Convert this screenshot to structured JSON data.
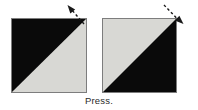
{
  "figure": {
    "width": 198,
    "height": 110,
    "background_color": "#ffffff",
    "caption": "Press.",
    "caption_color": "#2a2a2a"
  },
  "colors": {
    "dark": "#0a0a0a",
    "light": "#d8d8d4",
    "border": "#7d7d7d",
    "arrow": "#1a1a1a",
    "background": "#ffffff"
  },
  "panels": [
    {
      "id": "left-square",
      "name": "square-before-press",
      "x": 11,
      "y": 18,
      "width": 76,
      "height": 75,
      "upper_left_triangle_color": "#0a0a0a",
      "lower_right_triangle_color": "#d8d8d4",
      "diagonal": "top-left to bottom-right",
      "border_color": "#7d7d7d"
    },
    {
      "id": "right-square",
      "name": "square-after-press",
      "x": 102,
      "y": 18,
      "width": 75,
      "height": 75,
      "upper_left_triangle_color": "#d8d8d4",
      "lower_right_triangle_color": "#0a0a0a",
      "diagonal": "top-left to bottom-right",
      "border_color": "#7d7d7d"
    }
  ],
  "arrows": [
    {
      "id": "left-arrow",
      "name": "arrow-up-left",
      "direction": "up-left",
      "style": "dashed",
      "color": "#1a1a1a",
      "x1": 84,
      "y1": 24,
      "x2": 68,
      "y2": 6
    },
    {
      "id": "right-arrow",
      "name": "arrow-down-right",
      "direction": "down-right",
      "style": "dashed",
      "color": "#1a1a1a",
      "x1": 164,
      "y1": 5,
      "x2": 183,
      "y2": 23
    }
  ]
}
